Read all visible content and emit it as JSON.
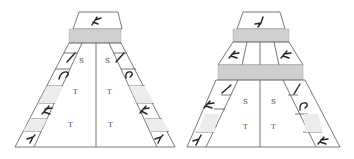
{
  "diagrams": [
    {
      "id": "left",
      "center_labels": {
        "left": [
          "S",
          "T",
          "T"
        ],
        "right": [
          "S",
          "T",
          "T"
        ]
      },
      "left_strip_cells": [
        "glyph-slash",
        "glyph-hook",
        "empty-shaded",
        "glyph-fork",
        "empty-shaded",
        "glyph-four"
      ],
      "right_strip_cells": [
        "glyph-slash",
        "glyph-hook",
        "empty-shaded",
        "glyph-fork",
        "empty-shaded",
        "glyph-four"
      ],
      "top_cell": "glyph-fork",
      "gray_bands": 1
    },
    {
      "id": "right",
      "center_labels": {
        "left": [
          "S",
          "T"
        ],
        "right": [
          "S",
          "T"
        ]
      },
      "upper_cells": [
        "glyph-fork",
        "glyph-fork"
      ],
      "left_strip_cells": [
        "glyph-slash",
        "glyph-fork",
        "empty-shaded",
        "glyph-four"
      ],
      "right_strip_cells": [
        "glyph-slash",
        "glyph-hook",
        "empty-shaded",
        "glyph-fork"
      ],
      "top_cell": "glyph-four",
      "gray_bands": 2
    }
  ],
  "colors": {
    "band": "#cfcfcf",
    "shaded_cell": "#ececec",
    "line": "#555555"
  }
}
